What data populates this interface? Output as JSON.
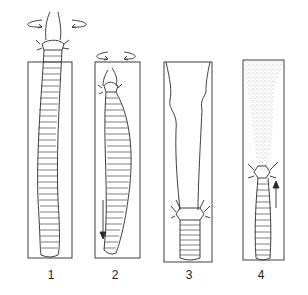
{
  "diagram": {
    "panels": [
      {
        "label": "1",
        "x": 51,
        "stage": "head emerging with rotation",
        "icon": "rotation-arrows-icon"
      },
      {
        "label": "2",
        "x": 115,
        "stage": "head rotating, body moving down",
        "icon": "down-arrow-icon"
      },
      {
        "label": "3",
        "x": 189,
        "stage": "empty burrow above, worm at bottom",
        "icon": ""
      },
      {
        "label": "4",
        "x": 261,
        "stage": "stippled sediment above, body moving up",
        "icon": "up-arrow-icon"
      }
    ],
    "colors": {
      "line": "#2a2a2a",
      "background": "#ffffff",
      "stipple": "#555555"
    }
  }
}
